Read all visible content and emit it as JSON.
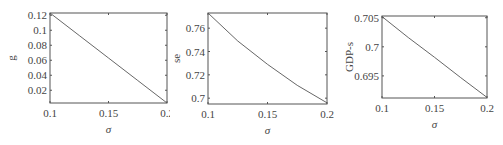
{
  "chart_data": [
    {
      "type": "line",
      "title": "",
      "xlabel": "σ",
      "ylabel": "g",
      "xlim": [
        0.1,
        0.2
      ],
      "ylim": [
        0.003,
        0.123
      ],
      "xticks": [
        "0.1",
        "0.15",
        "0.2"
      ],
      "yticks": [
        "0.02",
        "0.04",
        "0.06",
        "0.08",
        "0.1",
        "0.12"
      ],
      "grid": false,
      "x": [
        0.1,
        0.125,
        0.15,
        0.175,
        0.2
      ],
      "series": [
        {
          "name": "g",
          "values": [
            0.123,
            0.093,
            0.063,
            0.033,
            0.003
          ]
        }
      ]
    },
    {
      "type": "line",
      "title": "",
      "xlabel": "σ",
      "ylabel": "se",
      "xlim": [
        0.1,
        0.2
      ],
      "ylim": [
        0.695,
        0.773
      ],
      "xticks": [
        "0.1",
        "0.15",
        "0.2"
      ],
      "yticks": [
        "0.7",
        "0.72",
        "0.74",
        "0.76"
      ],
      "grid": false,
      "x": [
        0.1,
        0.125,
        0.15,
        0.175,
        0.2
      ],
      "series": [
        {
          "name": "se",
          "values": [
            0.773,
            0.749,
            0.729,
            0.711,
            0.696
          ]
        }
      ]
    },
    {
      "type": "line",
      "title": "",
      "xlabel": "σ",
      "ylabel": "GDP-s",
      "xlim": [
        0.1,
        0.2
      ],
      "ylim": [
        0.6912,
        0.7053
      ],
      "xticks": [
        "0.1",
        "0.15",
        "0.2"
      ],
      "yticks": [
        "0.695",
        "0.7",
        "0.705"
      ],
      "grid": false,
      "x": [
        0.1,
        0.125,
        0.15,
        0.175,
        0.2
      ],
      "series": [
        {
          "name": "GDP-s",
          "values": [
            0.7052,
            0.7016,
            0.6982,
            0.6947,
            0.6913
          ]
        }
      ]
    }
  ],
  "panels": [
    {
      "ylabel": "g",
      "xlabel": "σ"
    },
    {
      "ylabel": "se",
      "xlabel": "σ"
    },
    {
      "ylabel": "GDP-s",
      "xlabel": "σ"
    }
  ],
  "colors": {
    "axis": "#555555",
    "line": "#555555",
    "text": "#444444"
  }
}
